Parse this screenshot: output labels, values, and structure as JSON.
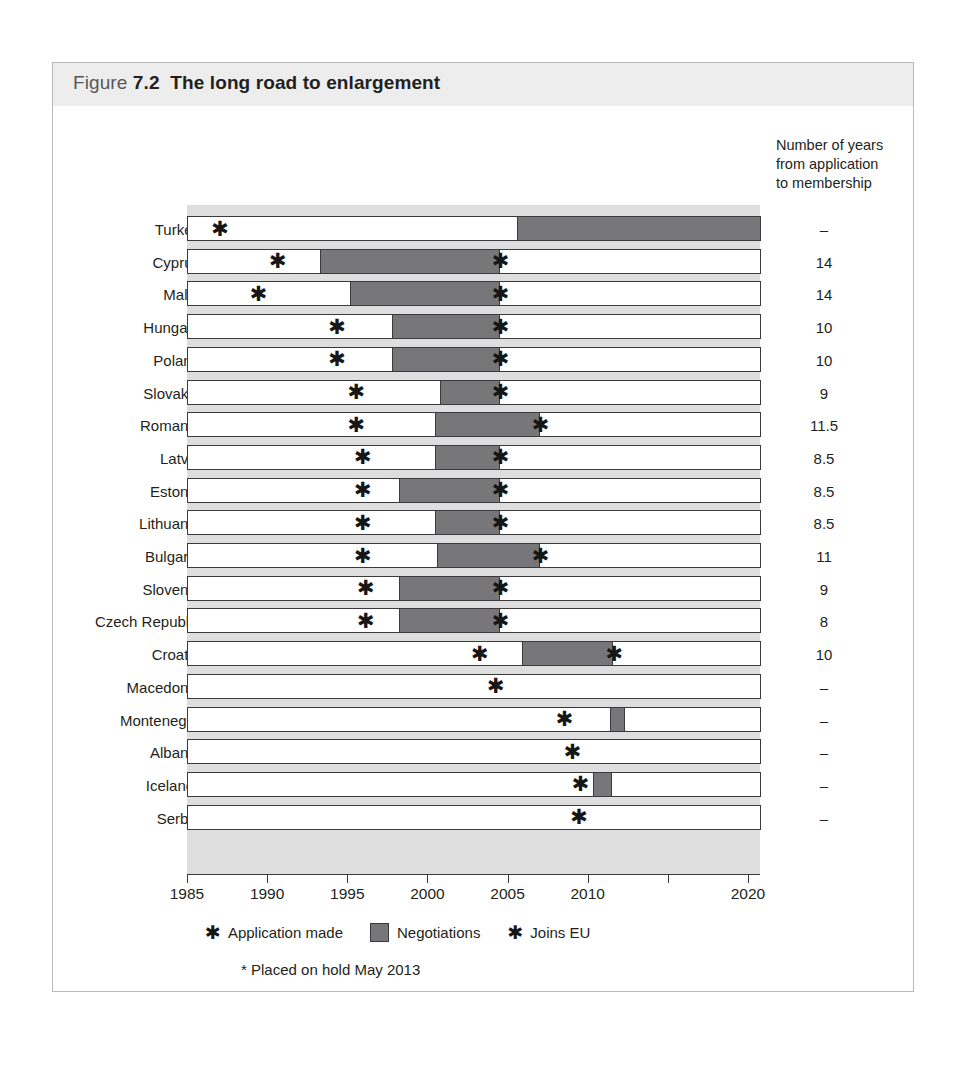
{
  "figure": {
    "label_word": "Figure",
    "number": "7.2",
    "title": "The long road to enlargement",
    "years_header": "Number of years\nfrom application\nto membership"
  },
  "legend": {
    "application_symbol": "✱",
    "application_label": "Application made",
    "negotiations_label": "Negotiations",
    "joins_symbol": "✱",
    "joins_label": "Joins EU",
    "negotiations_color": "#77777a"
  },
  "footnote": "* Placed on hold May 2013",
  "colors": {
    "plot_background": "#dededf",
    "bar_fill": "#ffffff",
    "bar_border": "#3a3a3c",
    "negotiations": "#77777a",
    "title_band": "#ededed",
    "text": "#231f20"
  },
  "chart_data": {
    "type": "bar",
    "title": "The long road to enlargement",
    "subtitle": "Figure 7.2",
    "xlabel": "",
    "ylabel": "",
    "xlim": [
      1985,
      2020
    ],
    "ticks": [
      1985,
      1990,
      1995,
      2000,
      2005,
      2010,
      2015,
      2020
    ],
    "tick_labels": [
      "1985",
      "1990",
      "1995",
      "2000",
      "2005",
      "2010",
      "2015",
      "2020"
    ],
    "grid": false,
    "legend_position": "bottom",
    "orientation": "horizontal",
    "value_column_header": "Number of years from application to membership",
    "categories": [
      "Turkey",
      "Cyprus",
      "Malta",
      "Hungary",
      "Poland",
      "Slovakia",
      "Romania",
      "Latvia",
      "Estonia",
      "Lithuania",
      "Bulgaria",
      "Slovenia",
      "Czech Republic",
      "Croatia",
      "Macedonia",
      "Montenegro",
      "Albania",
      "Iceland*",
      "Serbia"
    ],
    "rows": [
      {
        "country": "Turkey",
        "bar_start": 1985,
        "bar_end": 2020.8,
        "neg_start": 2005.6,
        "neg_end": 2020.8,
        "application": 1987.0,
        "joins": null,
        "years": "–"
      },
      {
        "country": "Cyprus",
        "bar_start": 1985,
        "bar_end": 2020.8,
        "neg_start": 1993.3,
        "neg_end": 2004.5,
        "application": 1990.6,
        "joins": 2004.5,
        "years": "14"
      },
      {
        "country": "Malta",
        "bar_start": 1985,
        "bar_end": 2020.8,
        "neg_start": 1995.2,
        "neg_end": 2004.5,
        "application": 1989.4,
        "joins": 2004.5,
        "years": "14"
      },
      {
        "country": "Hungary",
        "bar_start": 1985,
        "bar_end": 2020.8,
        "neg_start": 1997.8,
        "neg_end": 2004.5,
        "application": 1994.3,
        "joins": 2004.5,
        "years": "10"
      },
      {
        "country": "Poland",
        "bar_start": 1985,
        "bar_end": 2020.8,
        "neg_start": 1997.8,
        "neg_end": 2004.5,
        "application": 1994.3,
        "joins": 2004.5,
        "years": "10"
      },
      {
        "country": "Slovakia",
        "bar_start": 1985,
        "bar_end": 2020.8,
        "neg_start": 2000.8,
        "neg_end": 2004.5,
        "application": 1995.5,
        "joins": 2004.5,
        "years": "9"
      },
      {
        "country": "Romania",
        "bar_start": 1985,
        "bar_end": 2020.8,
        "neg_start": 2000.5,
        "neg_end": 2007.0,
        "application": 1995.5,
        "joins": 2007.0,
        "years": "11.5"
      },
      {
        "country": "Latvia",
        "bar_start": 1985,
        "bar_end": 2020.8,
        "neg_start": 2000.5,
        "neg_end": 2004.5,
        "application": 1995.9,
        "joins": 2004.5,
        "years": "8.5"
      },
      {
        "country": "Estonia",
        "bar_start": 1985,
        "bar_end": 2020.8,
        "neg_start": 1998.2,
        "neg_end": 2004.5,
        "application": 1995.9,
        "joins": 2004.5,
        "years": "8.5"
      },
      {
        "country": "Lithuania",
        "bar_start": 1985,
        "bar_end": 2020.8,
        "neg_start": 2000.5,
        "neg_end": 2004.5,
        "application": 1995.9,
        "joins": 2004.5,
        "years": "8.5"
      },
      {
        "country": "Bulgaria",
        "bar_start": 1985,
        "bar_end": 2020.8,
        "neg_start": 2000.6,
        "neg_end": 2007.0,
        "application": 1995.9,
        "joins": 2007.0,
        "years": "11"
      },
      {
        "country": "Slovenia",
        "bar_start": 1985,
        "bar_end": 2020.8,
        "neg_start": 1998.2,
        "neg_end": 2004.5,
        "application": 1996.1,
        "joins": 2004.5,
        "years": "9"
      },
      {
        "country": "Czech Republic",
        "bar_start": 1985,
        "bar_end": 2020.8,
        "neg_start": 1998.2,
        "neg_end": 2004.5,
        "application": 1996.1,
        "joins": 2004.5,
        "years": "8"
      },
      {
        "country": "Croatia",
        "bar_start": 1985,
        "bar_end": 2020.8,
        "neg_start": 2005.9,
        "neg_end": 2011.6,
        "application": 2003.2,
        "joins": 2011.6,
        "years": "10"
      },
      {
        "country": "Macedonia",
        "bar_start": 1985,
        "bar_end": 2020.8,
        "neg_start": null,
        "neg_end": null,
        "application": 2004.2,
        "joins": null,
        "years": "–"
      },
      {
        "country": "Montenegro",
        "bar_start": 1985,
        "bar_end": 2020.8,
        "neg_start": 2011.4,
        "neg_end": 2012.3,
        "application": 2008.5,
        "joins": null,
        "years": "–"
      },
      {
        "country": "Albania",
        "bar_start": 1985,
        "bar_end": 2020.8,
        "neg_start": null,
        "neg_end": null,
        "application": 2009.0,
        "joins": null,
        "years": "–"
      },
      {
        "country": "Iceland*",
        "bar_start": 1985,
        "bar_end": 2020.8,
        "neg_start": 2010.3,
        "neg_end": 2011.5,
        "application": 2009.5,
        "joins": null,
        "years": "–"
      },
      {
        "country": "Serbia",
        "bar_start": 1985,
        "bar_end": 2020.8,
        "neg_start": null,
        "neg_end": null,
        "application": 2009.4,
        "joins": null,
        "years": "–"
      }
    ]
  }
}
